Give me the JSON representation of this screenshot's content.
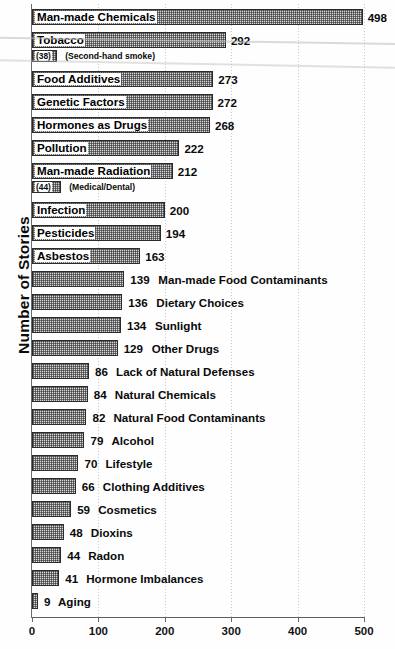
{
  "chart_data": {
    "type": "bar",
    "orientation": "horizontal",
    "title": "",
    "subtitle": "",
    "xlabel": "",
    "ylabel": "Number of Stories",
    "xlim": [
      0,
      500
    ],
    "xticks": [
      0,
      100,
      200,
      300,
      400,
      500
    ],
    "xtick_labels": [
      "0",
      "100",
      "200",
      "300",
      "400",
      "500"
    ],
    "grid": true,
    "grid_axis": "x",
    "grid_style": "dotted",
    "legend": "none",
    "categories": [
      "Man-made Chemicals",
      "Tobacco",
      "Food Additives",
      "Genetic Factors",
      "Hormones as Drugs",
      "Pollution",
      "Man-made Radiation",
      "Infection",
      "Pesticides",
      "Asbestos",
      "Man-made Food Contaminants",
      "Dietary Choices",
      "Sunlight",
      "Other Drugs",
      "Lack of Natural Defenses",
      "Natural Chemicals",
      "Natural Food Contaminants",
      "Alcohol",
      "Lifestyle",
      "Clothing Additives",
      "Cosmetics",
      "Dioxins",
      "Radon",
      "Hormone Imbalances",
      "Aging"
    ],
    "values": [
      498,
      292,
      273,
      272,
      268,
      222,
      212,
      200,
      194,
      163,
      139,
      136,
      134,
      129,
      86,
      84,
      82,
      79,
      70,
      66,
      59,
      48,
      44,
      41,
      9
    ],
    "sub_bars": [
      {
        "parent": "Tobacco",
        "label": "(Second-hand smoke)",
        "value": 38,
        "value_label": "(38)"
      },
      {
        "parent": "Man-made Radiation",
        "label": "(Medical/Dental)",
        "value": 44,
        "value_label": "(44)"
      }
    ]
  },
  "rows": [
    {
      "category": "Man-made Chemicals",
      "value": 498,
      "value_label": "498",
      "label_placement": "inside"
    },
    {
      "category": "Tobacco",
      "value": 292,
      "value_label": "292",
      "label_placement": "inside"
    },
    {
      "category": "",
      "value": 38,
      "value_label": "(38)",
      "note": "(Second-hand smoke)",
      "label_placement": "sub"
    },
    {
      "category": "Food Additives",
      "value": 273,
      "value_label": "273",
      "label_placement": "inside"
    },
    {
      "category": "Genetic Factors",
      "value": 272,
      "value_label": "272",
      "label_placement": "inside"
    },
    {
      "category": "Hormones as Drugs",
      "value": 268,
      "value_label": "268",
      "label_placement": "inside"
    },
    {
      "category": "Pollution",
      "value": 222,
      "value_label": "222",
      "label_placement": "inside"
    },
    {
      "category": "Man-made Radiation",
      "value": 212,
      "value_label": "212",
      "label_placement": "inside"
    },
    {
      "category": "",
      "value": 44,
      "value_label": "(44)",
      "note": "(Medical/Dental)",
      "label_placement": "sub"
    },
    {
      "category": "Infection",
      "value": 200,
      "value_label": "200",
      "label_placement": "inside"
    },
    {
      "category": "Pesticides",
      "value": 194,
      "value_label": "194",
      "label_placement": "inside"
    },
    {
      "category": "Asbestos",
      "value": 163,
      "value_label": "163",
      "label_placement": "inside"
    },
    {
      "category": "Man-made Food Contaminants",
      "value": 139,
      "value_label": "139",
      "label_placement": "outside"
    },
    {
      "category": "Dietary Choices",
      "value": 136,
      "value_label": "136",
      "label_placement": "outside"
    },
    {
      "category": "Sunlight",
      "value": 134,
      "value_label": "134",
      "label_placement": "outside"
    },
    {
      "category": "Other Drugs",
      "value": 129,
      "value_label": "129",
      "label_placement": "outside"
    },
    {
      "category": "Lack of Natural Defenses",
      "value": 86,
      "value_label": "86",
      "label_placement": "outside"
    },
    {
      "category": "Natural Chemicals",
      "value": 84,
      "value_label": "84",
      "label_placement": "outside"
    },
    {
      "category": "Natural Food Contaminants",
      "value": 82,
      "value_label": "82",
      "label_placement": "outside"
    },
    {
      "category": "Alcohol",
      "value": 79,
      "value_label": "79",
      "label_placement": "outside"
    },
    {
      "category": "Lifestyle",
      "value": 70,
      "value_label": "70",
      "label_placement": "outside"
    },
    {
      "category": "Clothing Additives",
      "value": 66,
      "value_label": "66",
      "label_placement": "outside"
    },
    {
      "category": "Cosmetics",
      "value": 59,
      "value_label": "59",
      "label_placement": "outside"
    },
    {
      "category": "Dioxins",
      "value": 48,
      "value_label": "48",
      "label_placement": "outside"
    },
    {
      "category": "Radon",
      "value": 44,
      "value_label": "44",
      "label_placement": "outside"
    },
    {
      "category": "Hormone Imbalances",
      "value": 41,
      "value_label": "41",
      "label_placement": "outside"
    },
    {
      "category": "Aging",
      "value": 9,
      "value_label": "9",
      "label_placement": "outside"
    }
  ],
  "axis": {
    "y_title": "Number of Stories",
    "x_ticks": [
      "0",
      "100",
      "200",
      "300",
      "400",
      "500"
    ]
  },
  "colors": {
    "bar_fill": "#d8d8d8",
    "bar_border": "#2b2b2b",
    "text": "#0a0a0a",
    "gridline": "#c9c9c9",
    "axis": "#5d5d5d",
    "background": "#fefefe"
  }
}
